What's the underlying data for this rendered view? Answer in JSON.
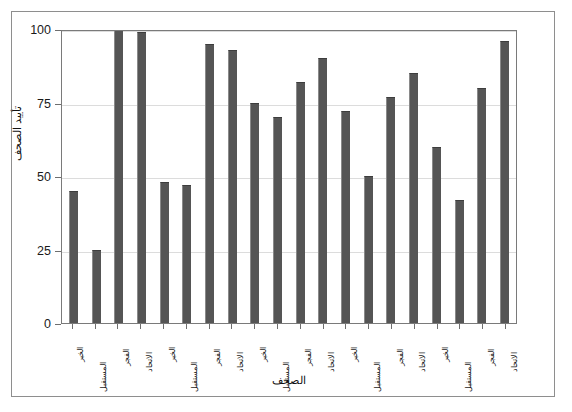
{
  "chart_data": {
    "type": "bar",
    "title": "",
    "xlabel": "الصحف",
    "ylabel": "تأييد الصحف",
    "ylim": [
      0,
      100
    ],
    "yticks": [
      0,
      25,
      50,
      75,
      100
    ],
    "ytick_labels": [
      "0",
      "25",
      "50",
      "75",
      "100"
    ],
    "grid": true,
    "legend": "none",
    "bar_color": "#555555",
    "categories": [
      "الخبر",
      "المستقبل",
      "الفجر",
      "الاتحاد",
      "الخبر",
      "المستقبل",
      "الفجر",
      "الاتحاد",
      "الخبر",
      "المستقبل",
      "الفجر",
      "الاتحاد",
      "الخبر",
      "المستقبل",
      "الفجر",
      "الاتحاد",
      "الخبر",
      "المستقبل",
      "الفجر",
      "الاتحاد"
    ],
    "values": [
      45,
      25,
      100,
      99,
      48,
      47,
      95,
      93,
      75,
      70,
      82,
      90,
      72,
      50,
      77,
      85,
      60,
      42,
      80,
      96
    ]
  }
}
